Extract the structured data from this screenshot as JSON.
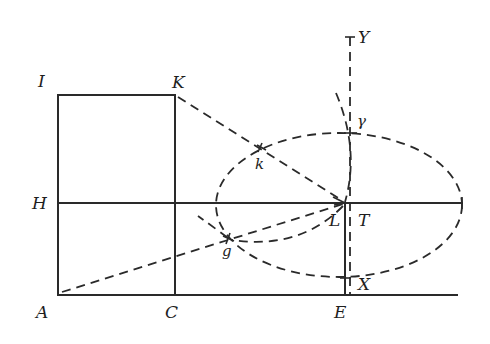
{
  "figure": {
    "points": {
      "A": {
        "label": "A",
        "x": 58,
        "y": 294
      },
      "I": {
        "label": "I",
        "x": 58,
        "y": 95
      },
      "K": {
        "label": "K",
        "x": 175,
        "y": 95
      },
      "C": {
        "label": "C",
        "x": 175,
        "y": 294
      },
      "H": {
        "label": "H",
        "x": 58,
        "y": 203
      },
      "E": {
        "label": "E",
        "x": 345,
        "y": 294
      },
      "L": {
        "label": "L",
        "x": 345,
        "y": 203
      },
      "T": {
        "label": "T",
        "x": 350,
        "y": 203
      },
      "X": {
        "label": "X",
        "x": 350,
        "y": 278
      },
      "Y": {
        "label": "Y",
        "x": 350,
        "y": 37
      },
      "gamma": {
        "label": "γ",
        "x": 350,
        "y": 133
      },
      "k": {
        "label": "k",
        "x": 262,
        "y": 149
      },
      "g": {
        "label": "g",
        "x": 229,
        "y": 239
      }
    },
    "ellipse": {
      "cx": 339,
      "cy": 205,
      "rx": 123,
      "ry": 72
    },
    "colors": {
      "ink": "#2a2a2a",
      "background": "#ffffff"
    }
  }
}
